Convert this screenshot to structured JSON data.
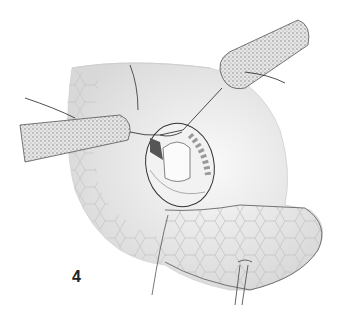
{
  "figure": {
    "label": "4",
    "colors": {
      "background": "#ffffff",
      "tissue": "#ececec",
      "tissue_shadow": "#cfcfcf",
      "outline": "#444444",
      "stipple": "#9a9a9a",
      "honeycomb": "#bdbdbd"
    }
  }
}
